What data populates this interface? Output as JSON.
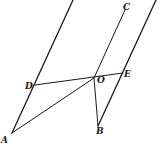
{
  "diagram": {
    "type": "geometric-figure",
    "points": {
      "A": {
        "label": "A",
        "x": 12,
        "y": 133
      },
      "B": {
        "label": "B",
        "x": 98,
        "y": 126
      },
      "C": {
        "label": "C",
        "x": 125,
        "y": 10
      },
      "D": {
        "label": "D",
        "x": 35,
        "y": 85
      },
      "O": {
        "label": "O",
        "x": 94,
        "y": 78
      },
      "E": {
        "label": "E",
        "x": 123,
        "y": 73
      }
    },
    "labels": {
      "A": "A",
      "B": "B",
      "C": "C",
      "D": "D",
      "O": "O",
      "E": "E"
    },
    "segments": [
      {
        "name": "left-parallel-line",
        "from": "top",
        "to": "A"
      },
      {
        "name": "line-OC",
        "from": "O",
        "to": "C"
      },
      {
        "name": "right-parallel-line",
        "from": "top",
        "to": "B"
      },
      {
        "name": "segment-DE",
        "from": "D",
        "to": "E"
      },
      {
        "name": "segment-AO",
        "from": "A",
        "to": "O"
      },
      {
        "name": "segment-OB",
        "from": "O",
        "to": "B"
      }
    ],
    "line_color": "#1a1a1a",
    "background": "#ffffff"
  }
}
